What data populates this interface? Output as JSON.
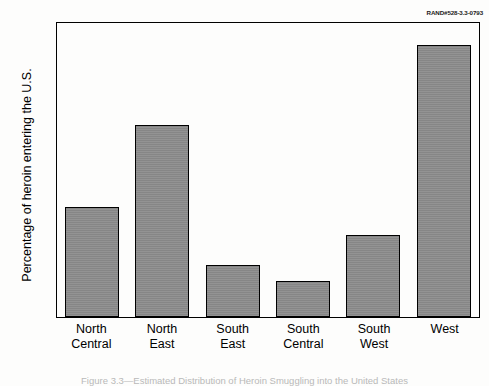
{
  "source_id": "RAND#528-3.3-0793",
  "caption": "Figure 3.3—Estimated Distribution of Heroin Smuggling into the United States",
  "colors": {
    "bar_fill": "#8d8d8d",
    "bar_edge": "#000000",
    "background": "#fdfdfc",
    "axis": "#000000"
  },
  "chart_data": {
    "type": "bar",
    "title": "",
    "xlabel": "",
    "ylabel": "Percentage of heroin entering the U.S.",
    "ylim": [
      0,
      40
    ],
    "yticks": [
      0,
      5,
      10,
      15,
      20,
      25,
      30,
      35,
      40
    ],
    "grid": false,
    "legend": null,
    "categories": [
      "North Central",
      "North East",
      "South East",
      "South Central",
      "South West",
      "West"
    ],
    "category_lines": [
      [
        "North",
        "Central"
      ],
      [
        "North",
        "East"
      ],
      [
        "South",
        "East"
      ],
      [
        "South",
        "Central"
      ],
      [
        "South",
        "West"
      ],
      [
        "West",
        ""
      ]
    ],
    "values": [
      14.8,
      25.9,
      7.0,
      4.9,
      11.1,
      36.8
    ]
  }
}
